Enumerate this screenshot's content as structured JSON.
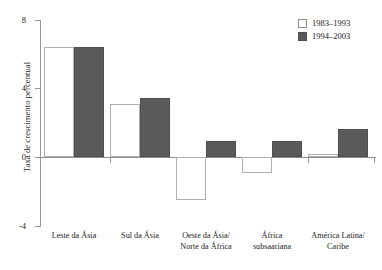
{
  "chart_data": {
    "type": "bar",
    "title": "",
    "xlabel": "",
    "ylabel": "Taxa de crescimento percentual",
    "ylim": [
      -4,
      8
    ],
    "yticks": [
      8,
      4,
      0,
      -4
    ],
    "ytick_labels": [
      "8",
      "4",
      "0",
      "-4"
    ],
    "grid": false,
    "legend_position": "top-right",
    "categories": [
      "Leste da Ásia",
      "Sul da Ásia",
      "Oeste da Ásia/\nNorte da África",
      "África\nsubsaariana",
      "América Latina/\nCaribe"
    ],
    "category_lines": [
      [
        "Leste da Ásia"
      ],
      [
        "Sul da Ásia"
      ],
      [
        "Oeste da Ásia/",
        "Norte da África"
      ],
      [
        "África",
        "subsaariana"
      ],
      [
        "América Latina/",
        "Caribe"
      ]
    ],
    "series": [
      {
        "name": "1983–1993",
        "color": "#ffffff",
        "values": [
          6.4,
          3.1,
          -2.5,
          -0.9,
          0.2
        ]
      },
      {
        "name": "1994–2003",
        "color": "#5a5a5a",
        "values": [
          6.4,
          3.4,
          0.9,
          0.9,
          1.6
        ]
      }
    ]
  },
  "legend": {
    "items": [
      {
        "label": "1983–1993",
        "swatch": "hollow"
      },
      {
        "label": "1994–2003",
        "swatch": "filled"
      }
    ]
  },
  "axis": {
    "y_title": "Taxa de crescimento percentual",
    "y_tick_labels": [
      "8",
      "4",
      "0",
      "-4"
    ]
  }
}
